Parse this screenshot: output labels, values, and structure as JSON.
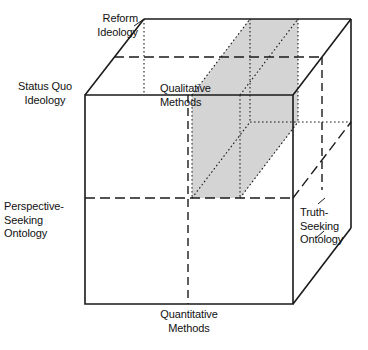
{
  "figure": {
    "name": "research-paradigm-cube",
    "type": "3d-cube-diagram",
    "background_color": "#ffffff",
    "line_color": "#1a1a1a",
    "shaded_region_color": "#d4d4d4"
  },
  "labels": {
    "reform_ideology": "Reform\nIdeology",
    "status_quo_ideology": "Status Quo\nIdeology",
    "perspective_seeking_ontology": "Perspective-\nSeeking\nOntology",
    "truth_seeking_ontology": "Truth-\nSeeking\nOntology",
    "qualitative_methods": "Qualitative\nMethods",
    "quantitative_methods": "Quantitative\nMethods"
  },
  "axes": [
    {
      "name": "ideology-axis",
      "poles": [
        "Status Quo Ideology",
        "Reform Ideology"
      ],
      "orientation": "depth"
    },
    {
      "name": "ontology-axis",
      "poles": [
        "Perspective-Seeking Ontology",
        "Truth-Seeking Ontology"
      ],
      "orientation": "horizontal"
    },
    {
      "name": "methods-axis",
      "poles": [
        "Quantitative Methods",
        "Qualitative Methods"
      ],
      "orientation": "vertical"
    }
  ],
  "geometry": {
    "front_face": {
      "left": 85,
      "top": 95,
      "right": 293,
      "bottom": 304
    },
    "depth_offset": {
      "dx": 58,
      "dy": -76
    },
    "shaded_slab": {
      "front_left": 192,
      "front_right": 240
    },
    "midline_front_vertical_x": 188,
    "midline_front_horizontal_y": 198
  }
}
